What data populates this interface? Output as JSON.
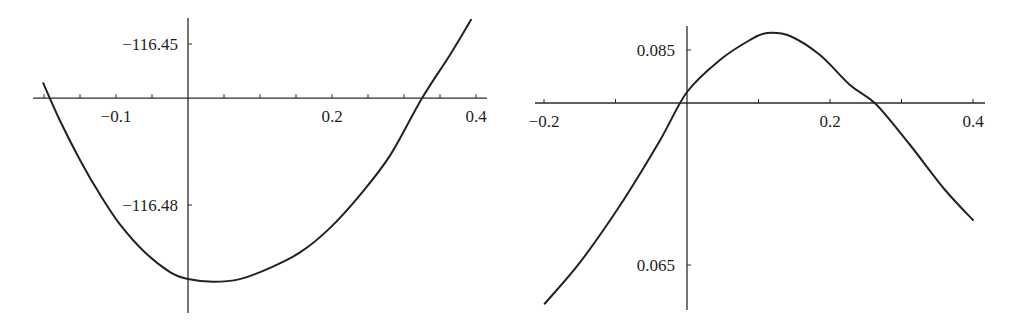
{
  "chart_data": [
    {
      "type": "line",
      "title": "",
      "xlabel": "",
      "ylabel": "",
      "xlim": [
        -0.21,
        0.41
      ],
      "ylim": [
        -116.4965,
        -116.4435
      ],
      "axes_origin": {
        "x": 0,
        "y": -116.4601
      },
      "grid": false,
      "x_ticks": [
        -0.2,
        -0.15,
        -0.1,
        -0.05,
        0.05,
        0.1,
        0.15,
        0.2,
        0.25,
        0.3,
        0.35,
        0.4
      ],
      "x_tick_labels": [
        {
          "value": -0.1,
          "label": "−0.1"
        },
        {
          "value": 0.2,
          "label": "0.2"
        },
        {
          "value": 0.4,
          "label": "0.4"
        }
      ],
      "y_ticks": [
        -116.45,
        -116.48
      ],
      "y_tick_labels": [
        {
          "value": -116.45,
          "label": "−116.45"
        },
        {
          "value": -116.48,
          "label": "−116.48"
        }
      ],
      "series": [
        {
          "name": "curve",
          "x": [
            -0.201,
            -0.178,
            -0.15,
            -0.122,
            -0.094,
            -0.06,
            -0.025,
            0.0,
            0.035,
            0.072,
            0.114,
            0.156,
            0.197,
            0.239,
            0.281,
            0.325,
            0.364,
            0.393
          ],
          "y": [
            -116.4573,
            -116.4642,
            -116.4716,
            -116.4781,
            -116.4837,
            -116.4888,
            -116.4925,
            -116.4938,
            -116.4943,
            -116.4938,
            -116.4917,
            -116.4888,
            -116.4843,
            -116.4781,
            -116.4707,
            -116.4601,
            -116.452,
            -116.4455
          ]
        }
      ]
    },
    {
      "type": "line",
      "title": "",
      "xlabel": "",
      "ylabel": "",
      "xlim": [
        -0.21,
        0.42
      ],
      "ylim": [
        0.0605,
        0.088
      ],
      "axes_origin": {
        "x": 0,
        "y": 0.08007
      },
      "grid": false,
      "x_ticks": [
        -0.2,
        -0.1,
        0.1,
        0.2,
        0.3,
        0.4
      ],
      "x_tick_labels": [
        {
          "value": -0.2,
          "label": "−0.2"
        },
        {
          "value": 0.2,
          "label": "0.2"
        },
        {
          "value": 0.4,
          "label": "0.4"
        }
      ],
      "y_ticks": [
        0.085,
        0.065
      ],
      "y_tick_labels": [
        {
          "value": 0.085,
          "label": "0.085"
        },
        {
          "value": 0.065,
          "label": "0.065"
        }
      ],
      "series": [
        {
          "name": "curve",
          "x": [
            -0.199,
            -0.15,
            -0.094,
            -0.038,
            0.0,
            0.046,
            0.088,
            0.112,
            0.144,
            0.186,
            0.228,
            0.264,
            0.312,
            0.361,
            0.4
          ],
          "y": [
            0.0614,
            0.06521,
            0.07051,
            0.07656,
            0.08109,
            0.08407,
            0.08593,
            0.08658,
            0.0863,
            0.08453,
            0.08174,
            0.07998,
            0.07616,
            0.07198,
            0.06919
          ]
        }
      ]
    }
  ]
}
